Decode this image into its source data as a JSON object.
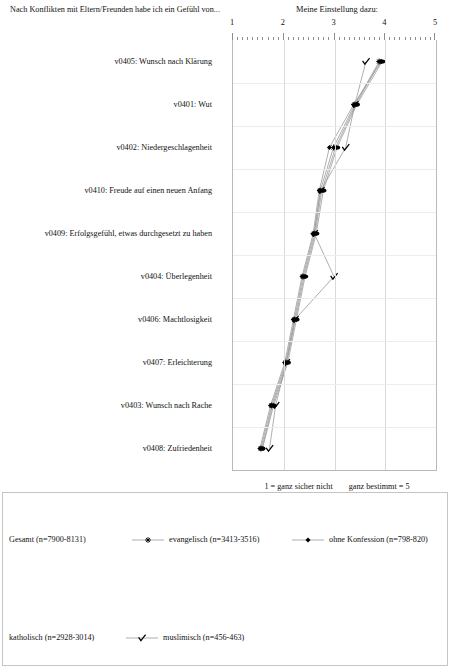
{
  "header": {
    "left_title": "Nach Konflikten mit Eltern/Freunden habe ich ein Gefühl von...",
    "right_title": "Meine Einstellung dazu:"
  },
  "notes": {
    "scale_low": "1 = ganz sicher nicht",
    "scale_high": "ganz bestimmt = 5",
    "range_note": "(Spannweite von n je Kategorie)"
  },
  "chart_data": {
    "type": "line",
    "orientation": "horizontal",
    "title": "Meine Einstellung dazu:",
    "xlabel": "",
    "ylabel": "Nach Konflikten mit Eltern/Freunden habe ich ein Gefühl von...",
    "xlim": [
      1,
      5
    ],
    "xticks": [
      1,
      2,
      3,
      4,
      5
    ],
    "xtick_labels": [
      "1",
      "2",
      "3",
      "4",
      "5"
    ],
    "grid": true,
    "legend_position": "bottom",
    "categories": [
      "v0405: Wunsch nach Klärung",
      "v0401: Wut",
      "v0402: Niedergeschlagenheit",
      "v0410: Freude auf einen neuen Anfang",
      "v0409: Erfolgsgefühl, etwas durchgesetzt zu haben",
      "v0404: Überlegenheit",
      "v0406: Machtlosigkeit",
      "v0407: Erleichterung",
      "v0403: Wunsch nach Rache",
      "v0408: Zufriedenheit"
    ],
    "series": [
      {
        "name": "Gesamt (n=7900-8131)",
        "marker": "dot",
        "values": [
          3.9,
          3.42,
          3.02,
          2.75,
          2.62,
          2.4,
          2.23,
          2.06,
          1.78,
          1.57
        ]
      },
      {
        "name": "evangelisch (n=3413-3516)",
        "marker": "star",
        "values": [
          3.88,
          3.4,
          2.98,
          2.72,
          2.6,
          2.38,
          2.21,
          2.04,
          1.76,
          1.55
        ]
      },
      {
        "name": "ohne Konfession (n=798-820)",
        "marker": "diamond",
        "values": [
          3.92,
          3.38,
          2.9,
          2.7,
          2.58,
          2.36,
          2.19,
          2.02,
          1.74,
          1.53
        ]
      },
      {
        "name": "katholisch (n=2928-3014)",
        "marker": "dot",
        "values": [
          3.94,
          3.44,
          3.05,
          2.78,
          2.64,
          2.42,
          2.25,
          2.08,
          1.8,
          1.58
        ]
      },
      {
        "name": "muslimisch (n=456-463)",
        "marker": "check",
        "values": [
          3.62,
          3.4,
          3.22,
          2.73,
          2.6,
          2.99,
          2.22,
          2.05,
          1.84,
          1.72
        ]
      }
    ]
  },
  "legend": {
    "items": [
      {
        "label": "Gesamt (n=7900-8131)",
        "marker": "none"
      },
      {
        "label": "evangelisch (n=3413-3516)",
        "marker": "star"
      },
      {
        "label": "ohne Konfession (n=798-820)",
        "marker": "diamond"
      },
      {
        "label": "katholisch (n=2928-3014)",
        "marker": "none"
      },
      {
        "label": "muslimisch (n=456-463)",
        "marker": "check"
      }
    ]
  },
  "colors": {
    "line": "#9a9a9a",
    "marker": "#000000",
    "grid": "#d9d9d9",
    "frame": "#b9b9b9",
    "text": "#111111"
  }
}
